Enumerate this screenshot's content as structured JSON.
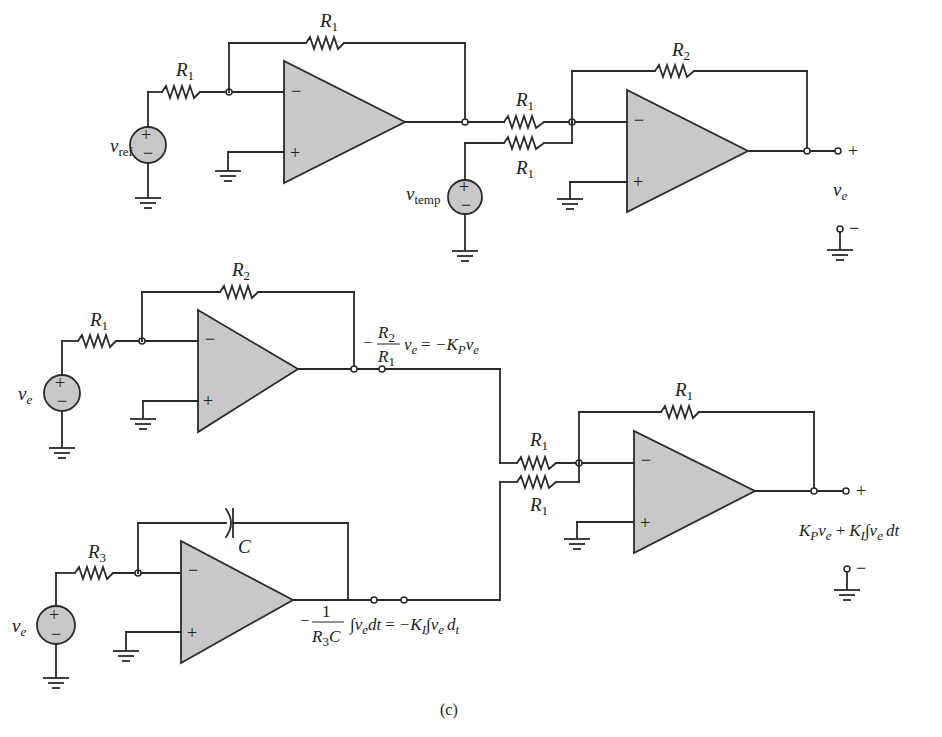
{
  "figure": {
    "caption": "(c)",
    "colors": {
      "component_fill": "#c8c8c8",
      "line": "#2a2a2a",
      "background": "#ffffff"
    }
  },
  "circuit_top": {
    "source_ref": {
      "name": "v",
      "sub": "ref",
      "plus": "+",
      "minus": "−"
    },
    "source_temp": {
      "name": "v",
      "sub": "temp",
      "plus": "+",
      "minus": "−"
    },
    "opamp1": {
      "inv": "−",
      "noninv": "+",
      "input_resistor": {
        "name": "R",
        "sub": "1"
      },
      "feedback_resistor": {
        "name": "R",
        "sub": "1"
      }
    },
    "summer": {
      "inv": "−",
      "noninv": "+",
      "input_resistor_a": {
        "name": "R",
        "sub": "1"
      },
      "input_resistor_b": {
        "name": "R",
        "sub": "1"
      },
      "feedback_resistor": {
        "name": "R",
        "sub": "2"
      }
    },
    "output": {
      "plus": "+",
      "minus": "−",
      "name": "v",
      "sub": "e"
    }
  },
  "circuit_bottom": {
    "proportional": {
      "source": {
        "name": "v",
        "sub": "e",
        "plus": "+",
        "minus": "−"
      },
      "inv": "−",
      "noninv": "+",
      "input_resistor": {
        "name": "R",
        "sub": "1"
      },
      "feedback_resistor": {
        "name": "R",
        "sub": "2"
      },
      "output_eq": {
        "neg": "−",
        "num_name": "R",
        "num_sub": "2",
        "den_name": "R",
        "den_sub": "1",
        "rhs_v": "v",
        "rhs_v_sub": "e",
        "equals": "=",
        "rhs": "−K",
        "rhs_sub": "P",
        "rhs_tail": "v",
        "rhs_tail_sub": "e"
      }
    },
    "integral": {
      "source": {
        "name": "v",
        "sub": "e",
        "plus": "+",
        "minus": "−"
      },
      "inv": "−",
      "noninv": "+",
      "input_resistor": {
        "name": "R",
        "sub": "3"
      },
      "feedback_capacitor": {
        "name": "C"
      },
      "output_eq": {
        "neg": "−",
        "num": "1",
        "den_name": "R",
        "den_sub": "3",
        "den_tail": "C",
        "integral": "∫",
        "v": "v",
        "v_sub": "e",
        "dt": "dt",
        "equals": "=",
        "rhs": "−K",
        "rhs_sub": "I",
        "rhs_integral": "∫",
        "rhs_v": "v",
        "rhs_v_sub": "e",
        "rhs_d": "d",
        "rhs_d_sub": "t"
      }
    },
    "adder": {
      "inv": "−",
      "noninv": "+",
      "input_resistor_a": {
        "name": "R",
        "sub": "1"
      },
      "input_resistor_b": {
        "name": "R",
        "sub": "1"
      },
      "feedback_resistor": {
        "name": "R",
        "sub": "1"
      },
      "output": {
        "plus": "+",
        "minus": "−",
        "k_p": "K",
        "k_p_sub": "P",
        "v1": "v",
        "v1_sub": "e",
        "op": "+",
        "k_i": "K",
        "k_i_sub": "I",
        "integral": "∫",
        "v2": "v",
        "v2_sub": "e",
        "dt": "dt"
      }
    }
  }
}
